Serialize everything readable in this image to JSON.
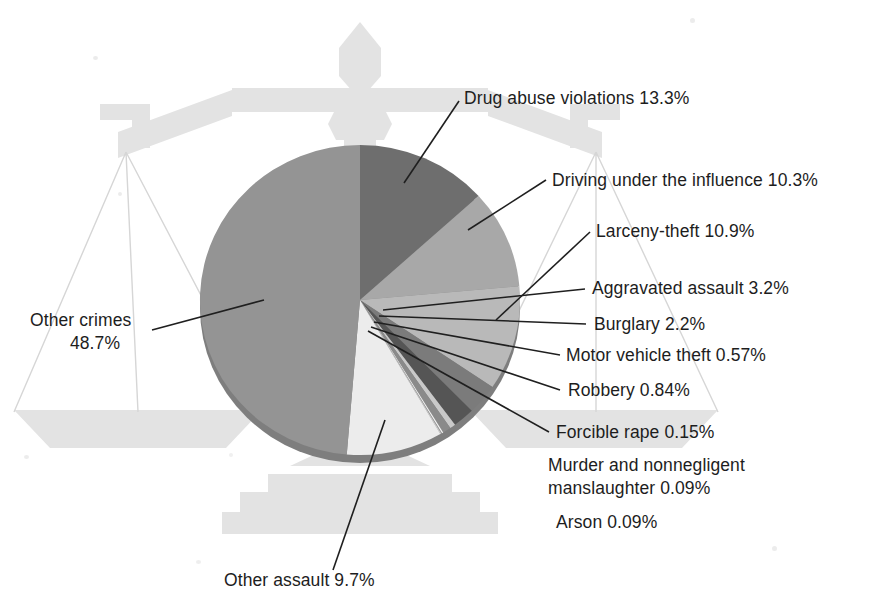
{
  "figure": {
    "background_color": "#ffffff",
    "watermark": {
      "name": "scales-of-justice",
      "color": "#e3e3e3",
      "line_color": "#d8d8d8"
    }
  },
  "chart_data": {
    "type": "pie",
    "title": "",
    "subtitle": "",
    "xlabel": "",
    "ylabel": "",
    "units": "%",
    "start_angle_deg": 0,
    "direction": "clockwise",
    "legend_position": "callout-labels",
    "grid": false,
    "categories": [
      "Drug abuse violations",
      "Driving under the influence",
      "Larceny-theft",
      "Aggravated assault",
      "Burglary",
      "Motor vehicle theft",
      "Robbery",
      "Forcible rape",
      "Murder and nonnegligent manslaughter",
      "Arson",
      "Other assault",
      "Other crimes"
    ],
    "values": [
      13.3,
      10.3,
      10.9,
      3.2,
      2.2,
      0.57,
      0.84,
      0.15,
      0.09,
      0.09,
      9.7,
      48.7
    ],
    "colors": [
      "#6e6e6e",
      "#a8a8a8",
      "#b9b9b9",
      "#7b7b7b",
      "#555555",
      "#c9c9c9",
      "#8a8a8a",
      "#f0f0f0",
      "#9d9d9d",
      "#d4d4d4",
      "#ececec",
      "#949494"
    ],
    "slices": [
      {
        "label": "Drug abuse violations",
        "value": 13.3,
        "display": "Drug abuse violations 13.3%",
        "color": "#6e6e6e"
      },
      {
        "label": "Driving under the influence",
        "value": 10.3,
        "display": "Driving under the influence 10.3%",
        "color": "#a8a8a8"
      },
      {
        "label": "Larceny-theft",
        "value": 10.9,
        "display": "Larceny-theft 10.9%",
        "color": "#b9b9b9"
      },
      {
        "label": "Aggravated assault",
        "value": 3.2,
        "display": "Aggravated assault 3.2%",
        "color": "#7b7b7b"
      },
      {
        "label": "Burglary",
        "value": 2.2,
        "display": "Burglary 2.2%",
        "color": "#555555"
      },
      {
        "label": "Motor vehicle theft",
        "value": 0.57,
        "display": "Motor vehicle theft 0.57%",
        "color": "#c9c9c9"
      },
      {
        "label": "Robbery",
        "value": 0.84,
        "display": "Robbery 0.84%",
        "color": "#8a8a8a"
      },
      {
        "label": "Forcible rape",
        "value": 0.15,
        "display": "Forcible rape 0.15%",
        "color": "#f0f0f0"
      },
      {
        "label": "Murder and nonnegligent manslaughter",
        "value": 0.09,
        "display": "Murder and nonnegligent\nmanslaughter 0.09%",
        "color": "#9d9d9d"
      },
      {
        "label": "Arson",
        "value": 0.09,
        "display": "Arson 0.09%",
        "color": "#d4d4d4"
      },
      {
        "label": "Other assault",
        "value": 9.7,
        "display": "Other assault 9.7%",
        "color": "#ececec"
      },
      {
        "label": "Other crimes",
        "value": 48.7,
        "display": "Other crimes\n48.7%",
        "color": "#949494"
      }
    ]
  },
  "labels": {
    "drug_abuse": "Drug abuse violations 13.3%",
    "dui": "Driving under the influence 10.3%",
    "larceny": "Larceny-theft 10.9%",
    "aggravated_assault": "Aggravated assault 3.2%",
    "burglary": "Burglary 2.2%",
    "motor_vehicle_theft": "Motor vehicle theft 0.57%",
    "robbery": "Robbery 0.84%",
    "forcible_rape": "Forcible rape 0.15%",
    "murder_line1": "Murder and nonnegligent",
    "murder_line2": "manslaughter 0.09%",
    "arson": "Arson 0.09%",
    "other_assault": "Other assault 9.7%",
    "other_crimes_line1": "Other crimes",
    "other_crimes_line2": "48.7%"
  }
}
